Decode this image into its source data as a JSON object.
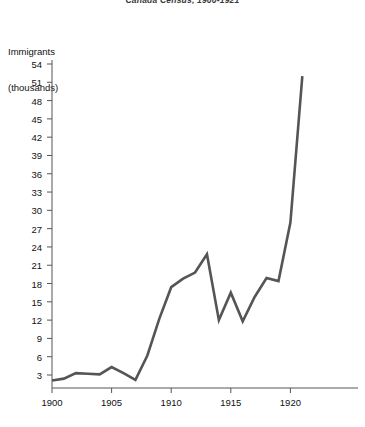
{
  "chart_data": {
    "type": "line",
    "title": "Canada Census, 1900-1921",
    "xlabel": "",
    "ylabel": "Immigrants (thousands)",
    "ylabel_line1": "Immigrants",
    "ylabel_line2": "(thousands)",
    "x": [
      1900,
      1901,
      1902,
      1903,
      1904,
      1905,
      1906,
      1907,
      1908,
      1909,
      1910,
      1911,
      1912,
      1913,
      1914,
      1915,
      1916,
      1917,
      1918,
      1919,
      1920,
      1921
    ],
    "values": [
      2.1,
      2.4,
      3.3,
      3.2,
      3.1,
      4.3,
      3.3,
      2.2,
      6.2,
      12.2,
      17.4,
      18.8,
      19.8,
      22.8,
      12.0,
      16.5,
      11.8,
      15.8,
      18.9,
      18.4,
      28.0,
      52.0
    ],
    "series": [
      {
        "name": "Immigrants (thousands)",
        "values": [
          2.1,
          2.4,
          3.3,
          3.2,
          3.1,
          4.3,
          3.3,
          2.2,
          6.2,
          12.2,
          17.4,
          18.8,
          19.8,
          22.8,
          12.0,
          16.5,
          11.8,
          15.8,
          18.9,
          18.4,
          28.0,
          52.0
        ],
        "color": "#555555"
      }
    ],
    "ylim": [
      0,
      55.5
    ],
    "xlim": [
      1899.6,
      1925.0
    ],
    "yticks": [
      3,
      6,
      9,
      12,
      15,
      18,
      21,
      24,
      27,
      30,
      33,
      36,
      39,
      42,
      45,
      48,
      51,
      54
    ],
    "ytick_labels": [
      "3",
      "6",
      "9",
      "12",
      "15",
      "18",
      "21",
      "24",
      "27",
      "30",
      "33",
      "36",
      "39",
      "42",
      "45",
      "48",
      "51",
      "54"
    ],
    "xticks": [
      1900,
      1905,
      1910,
      1915,
      1920
    ],
    "xtick_labels": [
      "1900",
      "1905",
      "1910",
      "1915",
      "1920"
    ],
    "grid": false,
    "legend": "none",
    "line_color": "#555555",
    "axis_color": "#555555",
    "line_width": 2.6
  }
}
